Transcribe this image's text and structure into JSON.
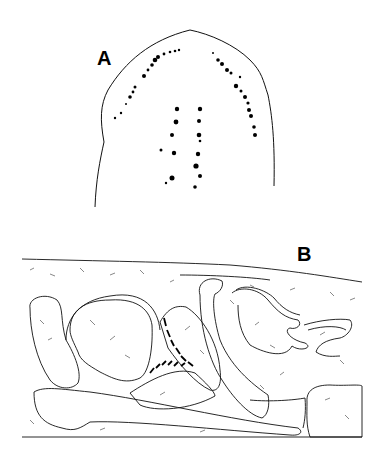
{
  "figure": {
    "panels": [
      {
        "label": "A",
        "description": "Anterior end outline with rows of dark pigment spots (eyespots)"
      },
      {
        "label": "B",
        "description": "Sagittal section line drawing of internal organs with stippled tissue"
      }
    ]
  },
  "colors": {
    "ink": "#000000",
    "background": "#ffffff",
    "stipple": "#555555"
  }
}
